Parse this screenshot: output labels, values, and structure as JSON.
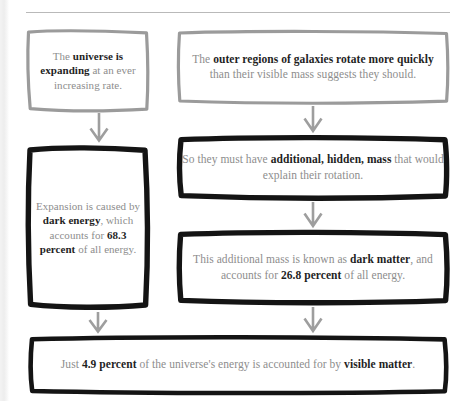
{
  "page": {
    "background_color": "#ffffff",
    "body_text_color": "#8d8d8d",
    "emphasis_text_color": "#1f1f1f",
    "grey_border_color": "#9b9b9b",
    "black_border_color": "#141414",
    "arrow_color": "#9e9e9e"
  },
  "flowchart": {
    "type": "flowchart",
    "nodes": [
      {
        "id": "expanding",
        "name": "universe-expanding",
        "column": "left",
        "border_style": "grey-sketch",
        "segments": [
          {
            "text": "The ",
            "bold": false
          },
          {
            "text": "universe is expanding",
            "bold": true
          },
          {
            "text": " at an ever increasing rate.",
            "bold": false
          }
        ],
        "plain_text": "The universe is expanding at an ever increasing rate."
      },
      {
        "id": "outer-regions",
        "name": "galaxy-rotation",
        "column": "right",
        "border_style": "grey-sketch",
        "segments": [
          {
            "text": "The ",
            "bold": false
          },
          {
            "text": "outer regions of galaxies rotate more quickly",
            "bold": true
          },
          {
            "text": " than their visible mass suggests they should.",
            "bold": false
          }
        ],
        "plain_text": "The outer regions of galaxies rotate more quickly than their visible mass suggests they should."
      },
      {
        "id": "dark-energy",
        "name": "dark-energy",
        "column": "left",
        "border_style": "black-sketch",
        "segments": [
          {
            "text": "Expansion is caused by ",
            "bold": false
          },
          {
            "text": "dark energy",
            "bold": true
          },
          {
            "text": ", which accounts for ",
            "bold": false
          },
          {
            "text": "68.3 percent",
            "bold": true
          },
          {
            "text": " of all energy.",
            "bold": false
          }
        ],
        "plain_text": "Expansion is caused by dark energy, which accounts for 68.3 percent of all energy."
      },
      {
        "id": "hidden-mass",
        "name": "hidden-mass",
        "column": "right",
        "border_style": "black-sketch",
        "segments": [
          {
            "text": "So they must have ",
            "bold": false
          },
          {
            "text": "additional, hidden, mass",
            "bold": true
          },
          {
            "text": " that would explain their rotation.",
            "bold": false
          }
        ],
        "plain_text": "So they must have additional, hidden, mass that would explain their rotation."
      },
      {
        "id": "dark-matter",
        "name": "dark-matter",
        "column": "right",
        "border_style": "black-sketch",
        "segments": [
          {
            "text": "This additional mass is known as ",
            "bold": false
          },
          {
            "text": "dark matter",
            "bold": true
          },
          {
            "text": ", and accounts for ",
            "bold": false
          },
          {
            "text": "26.8 percent",
            "bold": true
          },
          {
            "text": " of all energy.",
            "bold": false
          }
        ],
        "plain_text": "This additional mass is known as dark matter, and accounts for 26.8 percent of all energy."
      },
      {
        "id": "visible-matter",
        "name": "visible-matter",
        "column": "full",
        "border_style": "black-sketch",
        "segments": [
          {
            "text": "Just ",
            "bold": false
          },
          {
            "text": "4.9 percent",
            "bold": true
          },
          {
            "text": " of the universe's energy is accounted for by ",
            "bold": false
          },
          {
            "text": "visible matter",
            "bold": true
          },
          {
            "text": ".",
            "bold": false
          }
        ],
        "plain_text": "Just 4.9 percent of the universe's energy is accounted for by visible matter."
      }
    ],
    "arrows": [
      {
        "id": "arrow-1",
        "from": "expanding",
        "to": "dark-energy",
        "direction": "down"
      },
      {
        "id": "arrow-2",
        "from": "outer-regions",
        "to": "hidden-mass",
        "direction": "down"
      },
      {
        "id": "arrow-3",
        "from": "hidden-mass",
        "to": "dark-matter",
        "direction": "down"
      },
      {
        "id": "arrow-4",
        "from": "dark-energy",
        "to": "visible-matter",
        "direction": "down"
      },
      {
        "id": "arrow-5",
        "from": "dark-matter",
        "to": "visible-matter",
        "direction": "down"
      }
    ],
    "figures": {
      "dark_energy_percent": "68.3 percent",
      "dark_matter_percent": "26.8 percent",
      "visible_matter_percent": "4.9 percent"
    }
  }
}
